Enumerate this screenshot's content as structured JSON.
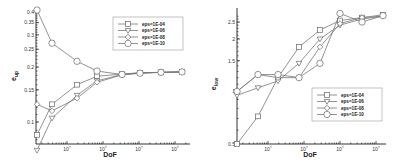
{
  "chart_data": [
    {
      "type": "line",
      "title": "",
      "xlabel": "DoF",
      "ylabel": "e_up",
      "x_scale": "log",
      "y_scale": "log",
      "x_tick_labels": [
        "10^?",
        "10^?",
        "10^?",
        "10^?"
      ],
      "y_tick_labels": [
        "0.1",
        "0.15",
        "0.2",
        "0.25",
        "0.3",
        "0.35",
        "0.4"
      ],
      "ylim": [
        0.076,
        0.42
      ],
      "grid": false,
      "legend_position": "upper right",
      "x_points": [
        0,
        1,
        2,
        3,
        4,
        5,
        6,
        7
      ],
      "series": [
        {
          "name": "eps=1E-04",
          "marker": "square",
          "values": [
            0.085,
            0.125,
            0.16,
            0.178,
            0.183,
            0.186,
            0.187,
            0.188
          ]
        },
        {
          "name": "eps=1E-06",
          "marker": "triangle",
          "values": [
            0.07,
            0.105,
            0.14,
            0.168,
            0.182,
            0.186,
            0.187,
            0.188
          ]
        },
        {
          "name": "eps=1E-08",
          "marker": "diamond",
          "values": [
            0.125,
            0.115,
            0.135,
            0.165,
            0.181,
            0.185,
            0.187,
            0.188
          ]
        },
        {
          "name": "eps=1E-10",
          "marker": "circle",
          "values": [
            0.41,
            0.27,
            0.215,
            0.19,
            0.182,
            0.185,
            0.187,
            0.188
          ]
        }
      ]
    },
    {
      "type": "line",
      "title": "",
      "xlabel": "DoF",
      "ylabel": "e_low",
      "x_scale": "log",
      "y_scale": "log",
      "x_tick_labels": [
        "10^?",
        "10^?",
        "10^?",
        "10^?"
      ],
      "y_tick_labels": [
        "0.5",
        "1",
        "1.5",
        "2",
        "2.5"
      ],
      "ylim": [
        0.5,
        2.9
      ],
      "grid": false,
      "legend_position": "lower right",
      "x_points": [
        0,
        1,
        2,
        3,
        4,
        5,
        6,
        7
      ],
      "series": [
        {
          "name": "eps=1E-04",
          "marker": "square",
          "values": [
            0.5,
            0.72,
            1.2,
            1.8,
            2.25,
            2.55,
            2.65,
            2.75
          ]
        },
        {
          "name": "eps=1E-06",
          "marker": "triangle",
          "values": [
            0.95,
            1.05,
            1.15,
            1.45,
            2.0,
            2.4,
            2.6,
            2.7
          ]
        },
        {
          "name": "eps=1E-08",
          "marker": "diamond",
          "values": [
            1.0,
            1.25,
            1.2,
            1.2,
            1.8,
            2.45,
            2.65,
            2.7
          ]
        },
        {
          "name": "eps=1E-10",
          "marker": "circle",
          "values": [
            1.0,
            1.25,
            1.25,
            1.2,
            1.45,
            2.8,
            2.5,
            2.72
          ]
        }
      ]
    }
  ],
  "left": {
    "xlabel": "DoF",
    "ylabel": "e",
    "ylabel_sub": "up",
    "xticks": [
      "10",
      "10",
      "10",
      "10"
    ],
    "yticks": [
      "0.4",
      "0.35",
      "0.3",
      "0.25",
      "0.2",
      "0.15",
      "0.1"
    ],
    "legend": [
      "eps=1E-04",
      "eps=1E-06",
      "eps=1E-08",
      "eps=1E-10"
    ]
  },
  "right": {
    "xlabel": "DoF",
    "ylabel": "e",
    "ylabel_sub": "low",
    "xticks": [
      "10",
      "10",
      "10",
      "10"
    ],
    "yticks": [
      "2.5",
      "2",
      "1.5",
      "1",
      "0.5"
    ],
    "legend": [
      "eps=1E-04",
      "eps=1E-06",
      "eps=1E-08",
      "eps=1E-10"
    ]
  }
}
